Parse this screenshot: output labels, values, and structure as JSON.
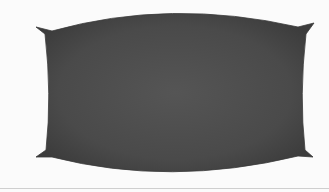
{
  "image": {
    "subject": "dark gray pillow-shaped fabric object",
    "background_color": "#fbfbfb",
    "object_color": "#4a4a4a",
    "object_highlight": "#5a5a5a",
    "object_shadow": "#3a3a3a",
    "divider_color": "#cfcfcf"
  }
}
